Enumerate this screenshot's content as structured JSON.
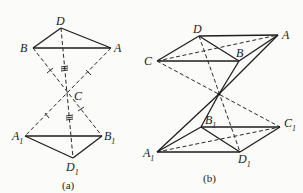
{
  "figure_a": {
    "caption": "(a)",
    "points": {
      "D": {
        "label": "D",
        "sub": ""
      },
      "B": {
        "label": "B",
        "sub": ""
      },
      "A": {
        "label": "A",
        "sub": ""
      },
      "C": {
        "label": "C",
        "sub": ""
      },
      "A1": {
        "label": "A",
        "sub": "1"
      },
      "B1": {
        "label": "B",
        "sub": "1"
      },
      "D1": {
        "label": "D",
        "sub": "1"
      }
    },
    "solid_edges": [
      "D-B",
      "D-A",
      "B-A",
      "A1-B1",
      "A1-D1",
      "D1-B1"
    ],
    "dashed_edges": [
      "B-C-B1",
      "A-C-A1",
      "D-C-D1"
    ],
    "equal_marks": {
      "single_tick": [
        "BC",
        "CB1"
      ],
      "single_tick_alt": [
        "AC",
        "CA1"
      ],
      "triple_tick": [
        "DC",
        "CD1"
      ]
    }
  },
  "figure_b": {
    "caption": "(b)",
    "points": {
      "D": {
        "label": "D",
        "sub": ""
      },
      "A": {
        "label": "A",
        "sub": ""
      },
      "B": {
        "label": "B",
        "sub": ""
      },
      "C": {
        "label": "C",
        "sub": ""
      },
      "B1": {
        "label": "B",
        "sub": "1"
      },
      "C1": {
        "label": "C",
        "sub": "1"
      },
      "A1": {
        "label": "A",
        "sub": "1"
      },
      "D1": {
        "label": "D",
        "sub": "1"
      }
    },
    "solid_edges": [
      "D-A",
      "D-C",
      "C-B",
      "B-A",
      "D-B",
      "A1-D1",
      "D1-C1",
      "A1-B1",
      "B1-C1",
      "B1-D1"
    ],
    "dashed_edges": [
      "C-A",
      "A1-C1",
      "C-O-C1",
      "D-O-D1",
      "A-O-A1",
      "B-O-B1"
    ]
  }
}
